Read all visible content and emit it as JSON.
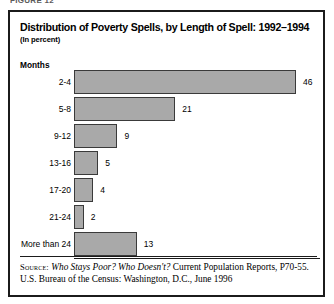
{
  "figure": {
    "caption_cutoff": "FIGURE 12"
  },
  "title": "Distribution of Poverty Spells, by Length of Spell: 1992–1994",
  "subtitle": "(In percent)",
  "axis_title": "Months",
  "source": {
    "keyword": "Source:",
    "italic_part": "Who Stays Poor? Who Doesn't?",
    "rest": " Current Population Reports, P70-55. U.S. Bureau of the Census: Washington, D.C., June 1996"
  },
  "colors": {
    "bar_fill": "#a9a9a9",
    "bar_outline": "#3a3a3a",
    "frame": "#1b1b1b",
    "text": "#000000"
  },
  "chart_data": {
    "type": "bar",
    "orientation": "horizontal",
    "title": "Distribution of Poverty Spells, by Length of Spell: 1992–1994",
    "subtitle": "(In percent)",
    "xlabel": "",
    "ylabel": "Months",
    "categories": [
      "2-4",
      "5-8",
      "9-12",
      "13-16",
      "17-20",
      "21-24",
      "More than 24"
    ],
    "values": [
      46,
      21,
      9,
      5,
      4,
      2,
      13
    ],
    "value_labels": [
      "46",
      "21",
      "9",
      "5",
      "4",
      "2",
      "13"
    ],
    "xlim": [
      0,
      46
    ],
    "grid": false,
    "legend": null,
    "units": "percent"
  }
}
